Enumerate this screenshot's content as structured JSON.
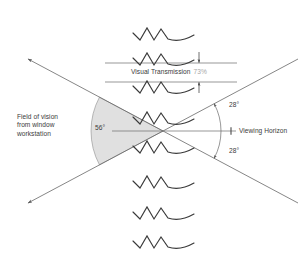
{
  "diagram": {
    "title": "Field of vision from window workstation",
    "labels": {
      "field_of_vision": "Field of vision\nfrom window\nworkstation",
      "center_angle": "56°",
      "upper_angle": "28°",
      "lower_angle": "28°",
      "viewing_horizon": "Viewing Horizon",
      "visual_transmission": "Visual Transmission",
      "visual_transmission_value": "73%"
    },
    "colors": {
      "line": "#555555",
      "wedge_fill": "#e0e0e0",
      "wedge_stroke": "#8a8a8a",
      "text": "#3b3b3b",
      "value_text": "#a7a7a7",
      "squiggle": "#3a3a3a",
      "background": "#ffffff"
    },
    "geometry": {
      "vertex_x": 163,
      "vertex_y": 131,
      "half_angle_deg": 28,
      "total_angle_deg": 56,
      "wedge_radius": 72,
      "right_arc_radius": 58
    },
    "glazing_units": [
      {
        "id": "louver-1",
        "y": 35
      },
      {
        "id": "louver-2",
        "y": 60
      },
      {
        "id": "louver-3",
        "y": 88
      },
      {
        "id": "louver-4",
        "y": 119
      },
      {
        "id": "louver-5",
        "y": 148
      },
      {
        "id": "louver-6",
        "y": 183
      },
      {
        "id": "louver-7",
        "y": 214
      },
      {
        "id": "louver-8",
        "y": 243
      }
    ],
    "transmission_band": {
      "top_line_y": 63,
      "bottom_line_y": 82,
      "line_left_x": 105,
      "line_right_x": 237
    },
    "icon_names": {
      "down_arrow": "arrow-down-icon",
      "up_arrow": "arrow-up-icon",
      "horizon_tick": "horizon-tick-icon",
      "sight_line_arrow": "sight-line-arrow-icon",
      "arc_arrow": "arc-arrow-icon",
      "louver": "glazing-louver-icon"
    }
  }
}
